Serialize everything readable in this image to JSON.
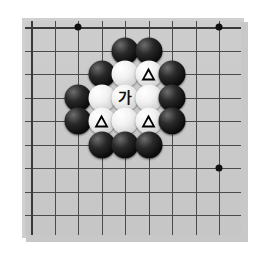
{
  "diagram": {
    "kind": "go-board-problem-diagram",
    "board_color": "#c9c9c9",
    "line_color": "#4a4a4a",
    "black_stone_color": "#0b0b0b",
    "white_stone_color": "#f2f2f2",
    "grid": {
      "columns": 9,
      "rows": 9,
      "spacing_px": 23.5,
      "origin_x_px": 6,
      "origin_y_px": 6
    },
    "star_points": [
      {
        "col": 2,
        "row": 0
      },
      {
        "col": 8,
        "row": 0
      },
      {
        "col": 8,
        "row": 6
      }
    ],
    "label_text": "가",
    "triangle_mark": "△",
    "stones": [
      {
        "color": "black",
        "col": 4,
        "row": 1,
        "mark": ""
      },
      {
        "color": "black",
        "col": 5,
        "row": 1,
        "mark": ""
      },
      {
        "color": "black",
        "col": 3,
        "row": 2,
        "mark": ""
      },
      {
        "color": "white",
        "col": 4,
        "row": 2,
        "mark": ""
      },
      {
        "color": "white",
        "col": 5,
        "row": 2,
        "mark": "triangle"
      },
      {
        "color": "black",
        "col": 6,
        "row": 2,
        "mark": ""
      },
      {
        "color": "black",
        "col": 2,
        "row": 3,
        "mark": ""
      },
      {
        "color": "white",
        "col": 3,
        "row": 3,
        "mark": ""
      },
      {
        "color": "white",
        "col": 4,
        "row": 3,
        "mark": "label"
      },
      {
        "color": "white",
        "col": 5,
        "row": 3,
        "mark": ""
      },
      {
        "color": "black",
        "col": 6,
        "row": 3,
        "mark": ""
      },
      {
        "color": "black",
        "col": 2,
        "row": 4,
        "mark": ""
      },
      {
        "color": "white",
        "col": 3,
        "row": 4,
        "mark": "triangle"
      },
      {
        "color": "white",
        "col": 4,
        "row": 4,
        "mark": ""
      },
      {
        "color": "white",
        "col": 5,
        "row": 4,
        "mark": "triangle"
      },
      {
        "color": "black",
        "col": 6,
        "row": 4,
        "mark": ""
      },
      {
        "color": "black",
        "col": 3,
        "row": 5,
        "mark": ""
      },
      {
        "color": "black",
        "col": 4,
        "row": 5,
        "mark": ""
      },
      {
        "color": "black",
        "col": 5,
        "row": 5,
        "mark": ""
      }
    ]
  }
}
